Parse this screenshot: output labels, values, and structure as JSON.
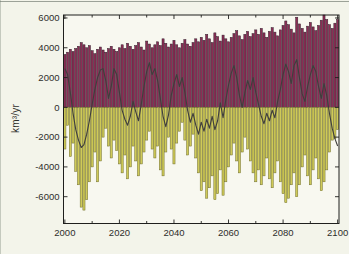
{
  "chart_data": {
    "type": "bar",
    "title": "",
    "xlabel": "",
    "ylabel": "km³/yr",
    "xlim": [
      1999.5,
      2100.5
    ],
    "ylim": [
      -7800,
      6200
    ],
    "x_ticks": [
      2000,
      2020,
      2040,
      2060,
      2080,
      2100
    ],
    "x_minor_tick_step": 10,
    "y_ticks": [
      -6000,
      -4000,
      -2000,
      0,
      2000,
      4000,
      6000
    ],
    "grid": false,
    "legend": "none",
    "colors": {
      "positive_bar_fill": "#8c2d55",
      "positive_bar_edge": "#33202d",
      "negative_bar_fill": "#cfca58",
      "negative_bar_edge": "#6e6c2c",
      "net_line": "#3f3e3c",
      "axis": "#1f1f1d",
      "tick_text": "#2e2e2a",
      "background": "#f3f4ea",
      "plot_background": "#f8f8f0"
    },
    "years": [
      2000,
      2001,
      2002,
      2003,
      2004,
      2005,
      2006,
      2007,
      2008,
      2009,
      2010,
      2011,
      2012,
      2013,
      2014,
      2015,
      2016,
      2017,
      2018,
      2019,
      2020,
      2021,
      2022,
      2023,
      2024,
      2025,
      2026,
      2027,
      2028,
      2029,
      2030,
      2031,
      2032,
      2033,
      2034,
      2035,
      2036,
      2037,
      2038,
      2039,
      2040,
      2041,
      2042,
      2043,
      2044,
      2045,
      2046,
      2047,
      2048,
      2049,
      2050,
      2051,
      2052,
      2053,
      2054,
      2055,
      2056,
      2057,
      2058,
      2059,
      2060,
      2061,
      2062,
      2063,
      2064,
      2065,
      2066,
      2067,
      2068,
      2069,
      2070,
      2071,
      2072,
      2073,
      2074,
      2075,
      2076,
      2077,
      2078,
      2079,
      2080,
      2081,
      2082,
      2083,
      2084,
      2085,
      2086,
      2087,
      2088,
      2089,
      2090,
      2091,
      2092,
      2093,
      2094,
      2095,
      2096,
      2097,
      2098,
      2099,
      2100
    ],
    "series": [
      {
        "name": "positive-bars",
        "render": "bar",
        "values": [
          3550,
          3700,
          3900,
          3750,
          3950,
          4100,
          4350,
          4200,
          4000,
          4150,
          3800,
          3600,
          3900,
          4050,
          3850,
          3700,
          3950,
          4100,
          3900,
          3750,
          4000,
          4200,
          3950,
          4300,
          4100,
          3900,
          4150,
          4350,
          4050,
          3850,
          4450,
          4250,
          4000,
          4200,
          4400,
          4150,
          4600,
          4300,
          4050,
          4250,
          4500,
          4200,
          4000,
          4300,
          4550,
          4250,
          4100,
          4350,
          4600,
          4400,
          4700,
          4500,
          4900,
          4600,
          4350,
          5000,
          4750,
          4450,
          4850,
          4600,
          4400,
          4700,
          4950,
          5150,
          4800,
          4550,
          4900,
          5100,
          4750,
          4950,
          5200,
          4900,
          5300,
          5000,
          4700,
          5100,
          5350,
          5050,
          4800,
          5200,
          5500,
          5800,
          5550,
          5250,
          5000,
          6050,
          5600,
          5300,
          5050,
          5450,
          5700,
          5400,
          5150,
          5500,
          5850,
          6200,
          5900,
          5550,
          5300,
          5650,
          5900
        ]
      },
      {
        "name": "negative-bars",
        "render": "bar",
        "values": [
          -2800,
          -1200,
          -3300,
          -2400,
          -4300,
          -5200,
          -6700,
          -6900,
          -6200,
          -5000,
          -4000,
          -3000,
          -5000,
          -3600,
          -2000,
          -1400,
          -2600,
          -3400,
          -2200,
          -2900,
          -3800,
          -4400,
          -3200,
          -4800,
          -4000,
          -2600,
          -3600,
          -4600,
          -3800,
          -3000,
          -2200,
          -1600,
          -2800,
          -3400,
          -2600,
          -4200,
          -4600,
          -3000,
          -2000,
          -2800,
          -3800,
          -2400,
          -1600,
          -1000,
          -2200,
          -3200,
          -2600,
          -1800,
          -3400,
          -4400,
          -5600,
          -5000,
          -6100,
          -5400,
          -4600,
          -6200,
          -5800,
          -4200,
          -5900,
          -5000,
          -4000,
          -3200,
          -2400,
          -3600,
          -4400,
          -3000,
          -2000,
          -2800,
          -3600,
          -4400,
          -5000,
          -4200,
          -5200,
          -4600,
          -3400,
          -4800,
          -5400,
          -4400,
          -3600,
          -5000,
          -5800,
          -6400,
          -6100,
          -5200,
          -4400,
          -6000,
          -5200,
          -4000,
          -3200,
          -4600,
          -5200,
          -4200,
          -3400,
          -4800,
          -5600,
          -5000,
          -4200,
          -3000,
          -2200,
          -2100,
          -1500
        ]
      },
      {
        "name": "net-line",
        "render": "line",
        "values": [
          2600,
          2200,
          1000,
          -400,
          -1500,
          -2200,
          -2700,
          -2500,
          -1800,
          -900,
          200,
          1200,
          2000,
          2500,
          2600,
          1800,
          600,
          1400,
          2600,
          2200,
          1000,
          -200,
          -800,
          -1200,
          -600,
          400,
          -300,
          -900,
          200,
          1400,
          2400,
          3000,
          2200,
          2600,
          1800,
          600,
          -600,
          -1300,
          -500,
          800,
          1600,
          2200,
          1400,
          2000,
          1000,
          -200,
          -1000,
          -400,
          -1200,
          -1800,
          -1000,
          -1600,
          -800,
          -1400,
          -600,
          -1500,
          -900,
          300,
          -700,
          500,
          1500,
          2300,
          2800,
          2000,
          800,
          0,
          1000,
          1800,
          1200,
          2000,
          1000,
          200,
          -600,
          -1100,
          -400,
          -900,
          -200,
          -700,
          400,
          1200,
          2200,
          2900,
          2400,
          1600,
          2800,
          3200,
          2000,
          900,
          400,
          1400,
          2200,
          2800,
          2400,
          1400,
          600,
          1600,
          800,
          -400,
          -1400,
          -2100,
          -2600
        ]
      }
    ]
  }
}
